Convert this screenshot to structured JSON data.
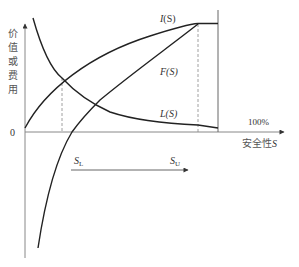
{
  "diagram": {
    "title": "",
    "y_axis_label": [
      "价",
      "值",
      "或",
      "费",
      "用"
    ],
    "x_axis_label": "安全性",
    "x_axis_var": "S",
    "origin_label": "0",
    "hundred_label": "100%",
    "curves": {
      "income": {
        "name": "I",
        "arg": "(S)"
      },
      "net": {
        "name": "F",
        "arg": "(S)"
      },
      "loss": {
        "name": "L",
        "arg": "(S)"
      }
    },
    "range": {
      "lower": {
        "main": "S",
        "sub": "L"
      },
      "upper": {
        "main": "S",
        "sub": "U"
      }
    },
    "colors": {
      "axis": "#888888",
      "curve": "#222222",
      "dashed": "#777777",
      "text": "#333333"
    }
  }
}
